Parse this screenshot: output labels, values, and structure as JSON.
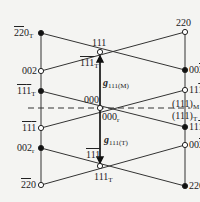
{
  "diagram": {
    "colors": {
      "line": "#333333",
      "background": "#f4f4f2",
      "text": "#222222"
    },
    "nodes": [
      {
        "id": "l1",
        "x": 41,
        "y": 33,
        "filled": true,
        "label": "220",
        "overline": "22",
        "sub": "T"
      },
      {
        "id": "l2",
        "x": 41,
        "y": 71,
        "filled": false,
        "label": "002",
        "sub": ""
      },
      {
        "id": "l3",
        "x": 41,
        "y": 91,
        "filled": true,
        "label": "111",
        "overline": "11",
        "sub": "T"
      },
      {
        "id": "l4",
        "x": 41,
        "y": 128,
        "filled": false,
        "label": "111",
        "overline": "11",
        "sub": ""
      },
      {
        "id": "l5",
        "x": 41,
        "y": 148,
        "filled": true,
        "label": "002",
        "sub": "r"
      },
      {
        "id": "l6",
        "x": 41,
        "y": 185,
        "filled": false,
        "label": "220",
        "overline": "22",
        "sub": ""
      },
      {
        "id": "r1",
        "x": 185,
        "y": 32,
        "filled": false,
        "label": "220",
        "sub": ""
      },
      {
        "id": "r2",
        "x": 185,
        "y": 70,
        "filled": true,
        "label": "002",
        "overline_last": true,
        "sub": "T"
      },
      {
        "id": "r3",
        "x": 185,
        "y": 90,
        "filled": false,
        "label": "111",
        "overline_last": true,
        "sub": ""
      },
      {
        "id": "r4",
        "x": 185,
        "y": 127,
        "filled": true,
        "label": "111",
        "overline_last": true,
        "sub": "T"
      },
      {
        "id": "r5",
        "x": 185,
        "y": 145,
        "filled": false,
        "label": "002",
        "overline_last": true,
        "sub": ""
      },
      {
        "id": "r6",
        "x": 185,
        "y": 186,
        "filled": true,
        "label": "220",
        "sub": "T"
      },
      {
        "id": "c1",
        "x": 100,
        "y": 52,
        "filled": false,
        "label": "111",
        "sub": ""
      },
      {
        "id": "c2",
        "x": 100,
        "y": 108,
        "filled": false,
        "label": "000",
        "sub": ""
      },
      {
        "id": "c3",
        "x": 100,
        "y": 166,
        "filled": false,
        "label": "111",
        "sub": "T"
      }
    ],
    "labels": {
      "l1": {
        "a": "22",
        "b": "0",
        "sub": "T"
      },
      "l2": {
        "a": "002"
      },
      "l3": {
        "a": "11",
        "b": "1",
        "sub": "T"
      },
      "l4": {
        "a": "11",
        "b": "1"
      },
      "l5": {
        "a": "002",
        "sub": "r"
      },
      "l6": {
        "a": "22",
        "b": "0"
      },
      "r1": {
        "a": "220"
      },
      "r2": {
        "a": "00",
        "b": "2",
        "sub": "T"
      },
      "r3": {
        "a": "11",
        "b": "1"
      },
      "r4": {
        "a": "11",
        "b": "1",
        "sub": "T"
      },
      "r5": {
        "a": "00",
        "b": "2"
      },
      "r6": {
        "a": "220",
        "sub": "T"
      },
      "c1": {
        "a": "111"
      },
      "c1b": {
        "a": "111",
        "sub": "T"
      },
      "c2": {
        "a": "000"
      },
      "c2b": {
        "a": "000",
        "sub": "r"
      },
      "c3a": {
        "a": "111"
      },
      "c3": {
        "a": "111",
        "sub": "T"
      },
      "planeM": {
        "a": "(111)",
        "sub": "M"
      },
      "planeT": {
        "a": "(111)",
        "sub": "T"
      },
      "gM": {
        "a": "g",
        "sub": "111(M)"
      },
      "gT": {
        "a": "g",
        "sub": "111(T)"
      }
    }
  }
}
